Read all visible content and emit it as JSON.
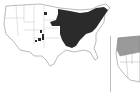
{
  "figure": {
    "panels": [
      {
        "id": "left",
        "subject": "United States map",
        "shading": "dark",
        "shade_color": "#2b2b2b",
        "region_shaded": "Midwest and Northeast states, plus scattered patches in western states"
      },
      {
        "id": "right",
        "subject": "United States map (partially visible)",
        "shading": "gray",
        "shade_color": "#9a9a9a",
        "region_shaded": "Northwestern states"
      }
    ],
    "colors": {
      "outline": "#8a8a8a",
      "land": "#ffffff",
      "divider": "#bdbdbd"
    }
  }
}
